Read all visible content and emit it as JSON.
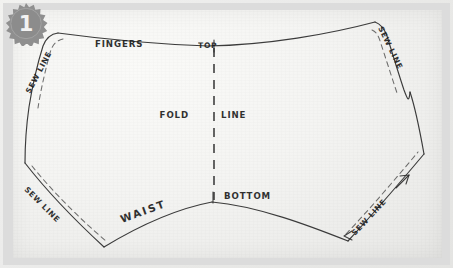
{
  "badge": {
    "number": "1",
    "shape": "starburst",
    "fill_color": "#8c8c8c",
    "text_color": "#f2f2f2"
  },
  "figure": {
    "kind": "hand-drawn sewing pattern",
    "medium": "pencil on paper photograph",
    "paper_color": "#f2f2f0",
    "ink_color": "#2b2b2b"
  },
  "labels": {
    "fingers": "FINGERS",
    "top": "TOP",
    "fold_line": "FOLD LINE",
    "fold_line_left": "FOLD",
    "fold_line_right": "LINE",
    "bottom": "BOTTOM",
    "waist": "WAIST",
    "sew_line": "SEW LINE",
    "sew_line_top_left": "SEW LINE",
    "sew_line_top_right": "SEW LINE",
    "sew_line_bottom_left": "SEW LINE",
    "sew_line_bottom_right": "SEW LINE"
  },
  "annotations": {
    "arrow_left": "←",
    "arrow_right": "→"
  }
}
